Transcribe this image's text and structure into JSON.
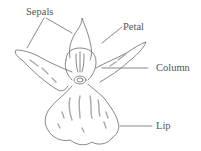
{
  "diagram": {
    "labels": {
      "sepals": "Sepals",
      "petal": "Petal",
      "column": "Column",
      "lip": "Lip"
    },
    "colors": {
      "line": "#6a6a6a",
      "shading": "#a8a8a8",
      "text": "#555555",
      "background": "#ffffff"
    }
  }
}
